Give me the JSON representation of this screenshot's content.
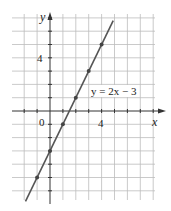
{
  "chart_data": {
    "type": "line",
    "title": "",
    "xlabel": "x",
    "ylabel": "y",
    "equation_label": "y = 2x − 3",
    "x_tick_labels": [
      {
        "value": 4,
        "label": "4"
      }
    ],
    "y_tick_labels": [
      {
        "value": 4,
        "label": "4"
      }
    ],
    "origin_label": "0",
    "xlim": [
      -3,
      8
    ],
    "ylim": [
      -6,
      7
    ],
    "grid": true,
    "series": [
      {
        "name": "y = 2x − 3",
        "line": {
          "x": [
            -1.9,
            4.9
          ],
          "y": [
            -6.8,
            6.8
          ]
        },
        "points": {
          "x": [
            -1,
            0,
            1,
            2,
            3,
            4
          ],
          "y": [
            -5,
            -3,
            -1,
            1,
            3,
            5
          ]
        }
      }
    ],
    "colors": {
      "line": "#555555",
      "grid": "#bdbdbd",
      "axis": "#333333",
      "point": "#444444"
    }
  }
}
